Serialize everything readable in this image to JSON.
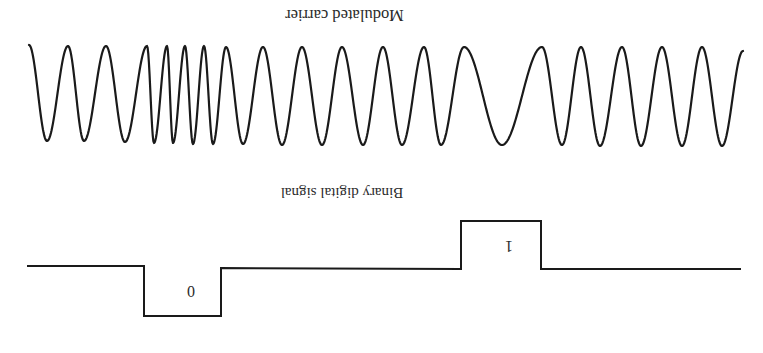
{
  "figure": {
    "orientation": "rotated-180",
    "stroke_color": "#1a1a1a",
    "background": "#ffffff"
  },
  "labels": {
    "carrier_title": "Modulated carrier",
    "binary_title": "Binary digital signal",
    "bit_zero": "0",
    "bit_one": "1"
  },
  "carrier": {
    "extrema": [
      [
        29,
        45
      ],
      [
        47,
        141
      ],
      [
        68,
        46
      ],
      [
        84,
        141
      ],
      [
        106,
        46
      ],
      [
        125,
        142
      ],
      [
        147,
        46
      ],
      [
        154,
        143
      ],
      [
        167,
        46
      ],
      [
        173,
        143
      ],
      [
        185,
        46
      ],
      [
        193,
        144
      ],
      [
        204,
        46
      ],
      [
        213,
        144
      ],
      [
        226,
        47
      ],
      [
        243,
        144
      ],
      [
        263,
        47
      ],
      [
        282,
        145
      ],
      [
        302,
        47
      ],
      [
        322,
        145
      ],
      [
        342,
        47
      ],
      [
        363,
        145
      ],
      [
        383,
        47
      ],
      [
        402,
        145
      ],
      [
        424,
        47
      ],
      [
        441,
        145
      ],
      [
        464,
        47
      ],
      [
        502,
        145
      ],
      [
        542,
        47
      ],
      [
        562,
        145
      ],
      [
        581,
        47
      ],
      [
        600,
        146
      ],
      [
        622,
        47
      ],
      [
        641,
        146
      ],
      [
        662,
        47
      ],
      [
        682,
        146
      ],
      [
        702,
        47
      ],
      [
        722,
        146
      ],
      [
        743,
        51
      ]
    ]
  },
  "binary_signal": {
    "points": [
      [
        27,
        266
      ],
      [
        144,
        266
      ],
      [
        144,
        316
      ],
      [
        221,
        316
      ],
      [
        221,
        268
      ],
      [
        461,
        269
      ],
      [
        461,
        221
      ],
      [
        541,
        221
      ],
      [
        541,
        269
      ],
      [
        741,
        269
      ]
    ],
    "bits": [
      {
        "value": "0",
        "x_start": 144,
        "x_end": 221
      },
      {
        "value": "1",
        "x_start": 461,
        "x_end": 541
      }
    ]
  }
}
